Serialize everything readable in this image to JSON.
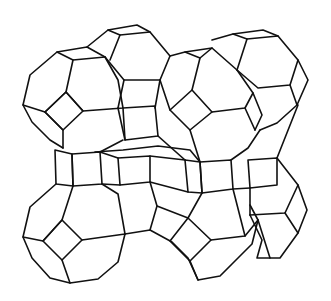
{
  "figure": {
    "background_color": "#ffffff",
    "line_color": "#111111",
    "caption": ""
  },
  "cages": [
    {
      "name": "cage-top-left"
    },
    {
      "name": "cage-top-center"
    },
    {
      "name": "cage-top-right"
    },
    {
      "name": "cage-middle-right"
    },
    {
      "name": "cage-center"
    },
    {
      "name": "cage-bottom-left"
    },
    {
      "name": "cage-bottom-center"
    },
    {
      "name": "cage-bottom-right"
    }
  ]
}
